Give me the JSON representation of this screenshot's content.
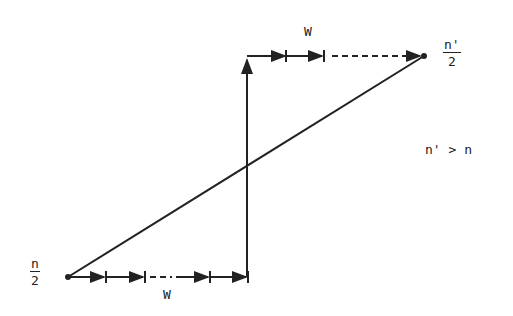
{
  "diagram": {
    "labels": {
      "top_w": "W",
      "bottom_w": "W",
      "left_fraction": {
        "numerator": "n",
        "denominator": "2"
      },
      "right_fraction": {
        "numerator": "n'",
        "denominator": "2"
      },
      "condition": "n' > n"
    },
    "colors": {
      "ink": "#222222",
      "background": "#ffffff"
    }
  }
}
